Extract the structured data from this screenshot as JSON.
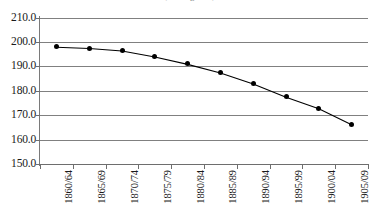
{
  "chart_data": {
    "type": "line",
    "title": "(in kilograms)",
    "subtitle": "",
    "xlabel": "",
    "ylabel": "",
    "categories": [
      "1860/64",
      "1865/69",
      "1870/74",
      "1875/79",
      "1880/84",
      "1885/89",
      "1890/94",
      "1895/99",
      "1900/04",
      "1905/09"
    ],
    "values": [
      198.0,
      197.5,
      196.5,
      194.0,
      191.0,
      187.5,
      183.0,
      177.5,
      172.8,
      166.3
    ],
    "series": [
      {
        "name": "series-1",
        "values": [
          198.0,
          197.5,
          196.5,
          194.0,
          191.0,
          187.5,
          183.0,
          177.5,
          172.8,
          166.3
        ]
      }
    ],
    "ylim": [
      150.0,
      210.0
    ],
    "ytick_step": 10.0,
    "ytick_labels": [
      "210.0",
      "200.0",
      "190.0",
      "180.0",
      "170.0",
      "160.0",
      "150.0"
    ],
    "ytick_values": [
      210.0,
      200.0,
      190.0,
      180.0,
      170.0,
      160.0,
      150.0
    ],
    "grid": true,
    "grid_orientation": "horizontal",
    "legend": false,
    "legend_position": "none",
    "marker": "filled-circle",
    "line_color": "#000000",
    "marker_color": "#000000",
    "grid_color": "#808080",
    "axis_color": "#6e6e6e",
    "background_color": "#ffffff",
    "annotations": []
  },
  "axes": {
    "y_axis_name": "y-axis",
    "x_axis_name": "x-axis"
  }
}
